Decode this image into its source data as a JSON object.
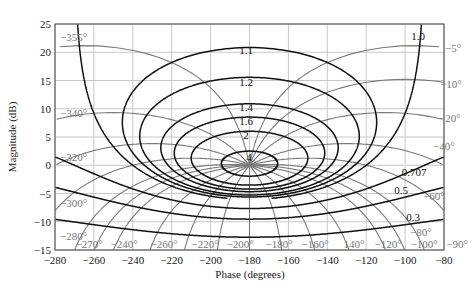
{
  "chart_data": {
    "type": "line",
    "title": "",
    "subtitle": "Nichols chart",
    "xlabel": "Phase (degrees)",
    "ylabel": "Magnitude (dB)",
    "xlim": [
      -280,
      -80
    ],
    "ylim": [
      -15,
      25
    ],
    "x_ticks": [
      -280,
      -260,
      -240,
      -220,
      -200,
      -180,
      -160,
      -140,
      -120,
      -100,
      -80
    ],
    "y_ticks": [
      -15,
      -10,
      -5,
      0,
      5,
      10,
      15,
      20,
      25
    ],
    "grid": true,
    "legend": null,
    "m_contours": {
      "description": "Constant closed-loop magnitude contours (M)",
      "values": [
        0.3,
        0.5,
        0.707,
        1.0,
        1.1,
        1.2,
        1.4,
        1.6,
        2,
        4
      ],
      "labels": [
        "0.3",
        "0.5",
        "0.707",
        "1.0",
        "1.1",
        "1.2",
        "1.4",
        "1.6",
        "2",
        "4"
      ],
      "color": "#111111"
    },
    "n_contours": {
      "description": "Constant closed-loop phase contours (N)",
      "values": [
        -5,
        -10,
        -20,
        -40,
        -60,
        -80,
        -90,
        -100,
        -120,
        -140,
        -160,
        -180,
        -200,
        -220,
        -240,
        -260,
        -270,
        -280,
        -300,
        -320,
        -340,
        -355
      ],
      "labels_right": [
        "-5°",
        "-10°",
        "-20°",
        "-40°",
        "-60°",
        "-80°"
      ],
      "labels_left": [
        "-355°",
        "-340°",
        "-320°",
        "-300°",
        "-280°"
      ],
      "labels_bottom": [
        "-270°",
        "-240°",
        "-260°",
        "-220°",
        "-200°",
        "-180°",
        "-160°",
        "140°",
        "-120°",
        "-100°",
        "-90°"
      ],
      "color": "#777777"
    }
  },
  "axes": {
    "xlabel": "Phase (degrees)",
    "ylabel": "Magnitude (dB)"
  },
  "colors": {
    "m_line": "#111111",
    "n_line": "#7a7a7a",
    "grid": "#c8c8c8",
    "frame": "#444444"
  }
}
